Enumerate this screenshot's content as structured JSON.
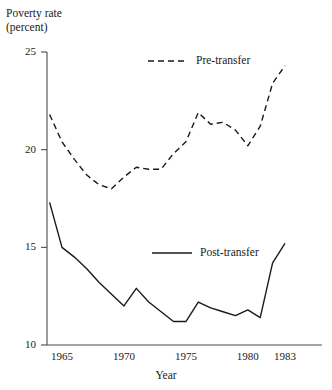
{
  "chart_data": {
    "type": "line",
    "title": "",
    "ylabel": "Poverty rate\n(percent)",
    "xlabel": "Year",
    "xlim": [
      1964,
      1983
    ],
    "ylim": [
      10,
      25
    ],
    "grid": false,
    "legend_position": "inside",
    "yticks": [
      "10",
      "15",
      "20",
      "25"
    ],
    "ytick_values": [
      10,
      15,
      20,
      25
    ],
    "xticks": [
      "1965",
      "1970",
      "1975",
      "1980",
      "1983"
    ],
    "xtick_values": [
      1965,
      1970,
      1975,
      1980,
      1983
    ],
    "x": [
      1964,
      1965,
      1966,
      1967,
      1968,
      1969,
      1970,
      1971,
      1972,
      1973,
      1974,
      1975,
      1976,
      1977,
      1978,
      1979,
      1980,
      1981,
      1982,
      1983
    ],
    "series": [
      {
        "name": "Pre-transfer",
        "style": "dashed",
        "color": "#1a1a1a",
        "values": [
          21.8,
          20.4,
          19.5,
          18.7,
          18.2,
          18.0,
          18.6,
          19.1,
          19.0,
          19.0,
          19.8,
          20.4,
          21.9,
          21.3,
          21.4,
          21.0,
          20.2,
          21.2,
          23.4,
          24.3
        ]
      },
      {
        "name": "Post-transfer",
        "style": "solid",
        "color": "#1a1a1a",
        "values": [
          17.3,
          15.0,
          14.5,
          13.9,
          13.2,
          12.6,
          12.0,
          12.9,
          12.2,
          11.7,
          11.2,
          11.2,
          12.2,
          11.9,
          11.7,
          11.5,
          11.8,
          11.4,
          14.2,
          15.2
        ]
      }
    ],
    "legend": [
      {
        "label": "Pre-transfer",
        "style": "dashed"
      },
      {
        "label": "Post-transfer",
        "style": "solid"
      }
    ]
  }
}
